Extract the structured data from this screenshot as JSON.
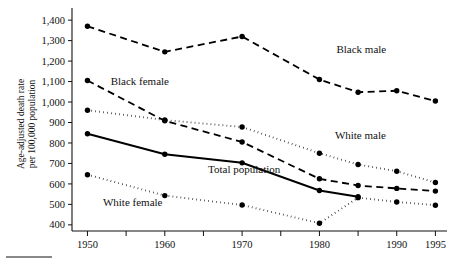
{
  "chart_data": {
    "type": "line",
    "title": "",
    "subtitle": "",
    "xlabel": "",
    "ylabel": "Age-adjusted death rate per 100,000 population",
    "ylabel_line1": "Age-adjusted death rate",
    "ylabel_line2": "per 100,000 population",
    "x": [
      1950,
      1960,
      1970,
      1980,
      1985,
      1990,
      1995
    ],
    "xlim": [
      1948,
      1996.5
    ],
    "ylim": [
      370,
      1430
    ],
    "xticks_major": [
      "1950",
      "1960",
      "1970",
      "1980",
      "1990",
      "1995"
    ],
    "xticks_major_values": [
      1950,
      1960,
      1970,
      1980,
      1990,
      1995
    ],
    "xticks_minor_values": [
      1955,
      1965,
      1975,
      1985
    ],
    "yticks": [
      "400",
      "500",
      "600",
      "700",
      "800",
      "900",
      "1,000",
      "1,100",
      "1,200",
      "1,300",
      "1,400"
    ],
    "ytick_values": [
      400,
      500,
      600,
      700,
      800,
      900,
      1000,
      1100,
      1200,
      1300,
      1400
    ],
    "grid": false,
    "legend": "inline-annotations",
    "series": [
      {
        "name": "Black male",
        "label": "Black male",
        "style": "dashed",
        "x": [
          1950,
          1960,
          1970,
          1980,
          1985,
          1990,
          1995
        ],
        "values": [
          1370,
          1245,
          1320,
          1110,
          1048,
          1055,
          1005
        ],
        "label_x": 1982.2,
        "label_y": 1258
      },
      {
        "name": "Black female",
        "label": "Black female",
        "style": "dashed",
        "x": [
          1950,
          1960,
          1970,
          1980,
          1985,
          1990,
          1995
        ],
        "values": [
          1105,
          908,
          805,
          625,
          592,
          578,
          565
        ],
        "label_x": 1953.0,
        "label_y": 1105
      },
      {
        "name": "White male",
        "label": "White male",
        "style": "dotted",
        "x": [
          1950,
          1960,
          1970,
          1980,
          1985,
          1990,
          1995
        ],
        "values": [
          960,
          912,
          878,
          750,
          695,
          662,
          607
        ],
        "label_x": 1982.0,
        "label_y": 838
      },
      {
        "name": "Total population",
        "label": "Total population",
        "style": "solid",
        "x": [
          1950,
          1960,
          1970,
          1980,
          1985
        ],
        "values": [
          845,
          745,
          703,
          568,
          537
        ],
        "label_x": 1965.6,
        "label_y": 672
      },
      {
        "name": "White female",
        "label": "White female",
        "style": "dotted",
        "x": [
          1950,
          1960,
          1970,
          1980,
          1985,
          1990,
          1995
        ],
        "values": [
          645,
          543,
          497,
          408,
          533,
          512,
          496
        ],
        "label_x": 1952.0,
        "label_y": 512
      }
    ]
  }
}
